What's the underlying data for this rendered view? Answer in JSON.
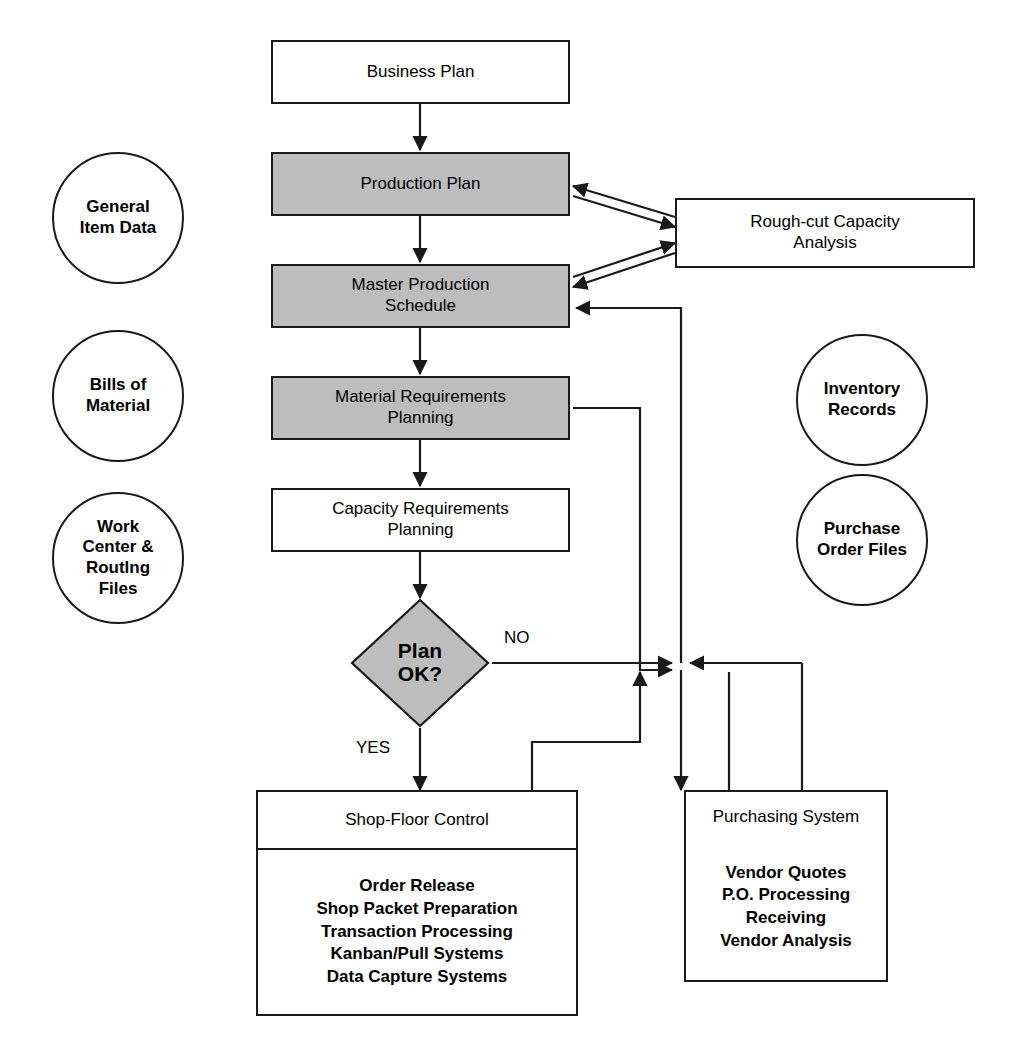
{
  "diagram": {
    "colors": {
      "shaded_fill": "#bdbdbd",
      "stroke": "#1a1a1a",
      "background": "#ffffff"
    }
  },
  "boxes": {
    "business_plan": {
      "label": "Business Plan",
      "shaded": false
    },
    "production_plan": {
      "label": "Production Plan",
      "shaded": true
    },
    "rough_cut": {
      "line1": "Rough-cut Capacity",
      "line2": "Analysis",
      "shaded": false
    },
    "master_production_schedule": {
      "line1": "Master Production",
      "line2": "Schedule",
      "shaded": true
    },
    "material_requirements_planning": {
      "line1": "Material Requirements",
      "line2": "Planning",
      "shaded": true
    },
    "capacity_requirements_planning": {
      "line1": "Capacity Requirements",
      "line2": "Planning",
      "shaded": false
    }
  },
  "decision": {
    "line1": "Plan",
    "line2": "OK?",
    "yes_label": "YES",
    "no_label": "NO"
  },
  "circles": {
    "general_item_data": {
      "line1": "General",
      "line2": "Item Data"
    },
    "bills_of_material": {
      "line1": "Bills of",
      "line2": "Material"
    },
    "work_center_routing": {
      "line1": "Work",
      "line2": "Center &",
      "line3": "Routlng",
      "line4": "Files"
    },
    "inventory_records": {
      "line1": "Inventory",
      "line2": "Records"
    },
    "purchase_order_files": {
      "line1": "Purchase",
      "line2": "Order Files"
    }
  },
  "shop_floor_control": {
    "header": "Shop-Floor Control",
    "items": [
      "Order Release",
      "Shop Packet Preparation",
      "Transaction Processing",
      "Kanban/Pull Systems",
      "Data Capture Systems"
    ]
  },
  "purchasing_system": {
    "header": "Purchasing System",
    "items": [
      "Vendor Quotes",
      "P.O. Processing",
      "Receiving",
      "Vendor Analysis"
    ]
  }
}
